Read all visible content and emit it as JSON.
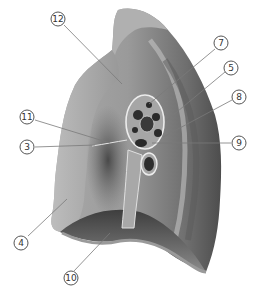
{
  "figure": {
    "palette": {
      "background": "#ffffff",
      "lung_light": "#b8b8b8",
      "lung_mid": "#8f8f8f",
      "lung_dark": "#4a4a4a",
      "hilum_outline": "#e6e6e6",
      "vessel_dark": "#2a2a2a",
      "leader_line": "#777777"
    },
    "labels": [
      {
        "id": "12",
        "text": "12",
        "x": 58,
        "y": 19,
        "target_x": 122,
        "target_y": 84
      },
      {
        "id": "7",
        "text": "7",
        "x": 221,
        "y": 43,
        "target_x": 149,
        "target_y": 104
      },
      {
        "id": "5",
        "text": "5",
        "x": 231,
        "y": 68,
        "target_x": 166,
        "target_y": 121
      },
      {
        "id": "8",
        "text": "8",
        "x": 239,
        "y": 97,
        "target_x": 163,
        "target_y": 137
      },
      {
        "id": "11",
        "text": "11",
        "x": 27,
        "y": 117,
        "target_x": 110,
        "target_y": 143
      },
      {
        "id": "9",
        "text": "9",
        "x": 239,
        "y": 143,
        "target_x": 152,
        "target_y": 143
      },
      {
        "id": "3",
        "text": "3",
        "x": 27,
        "y": 147,
        "target_x": 95,
        "target_y": 145
      },
      {
        "id": "4",
        "text": "4",
        "x": 21,
        "y": 243,
        "target_x": 67,
        "target_y": 199
      },
      {
        "id": "10",
        "text": "10",
        "x": 71,
        "y": 278,
        "target_x": 110,
        "target_y": 233
      }
    ]
  }
}
